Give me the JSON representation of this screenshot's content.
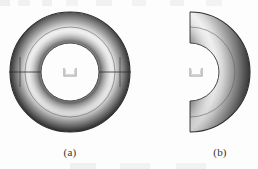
{
  "figure": {
    "kind": "torus-geometry-figure",
    "background_color": "#fdfdfd",
    "panels": [
      {
        "id": "a",
        "caption": "(a)",
        "shape_name": "full-torus",
        "description": "Shaded full torus (annulus) with inner circular outline, horizontal centre line and square origin marker",
        "center": {
          "x": 70,
          "y": 72
        },
        "outer_radius": 62,
        "inner_radius": 30,
        "mid_ring_radius": 46,
        "has_center_marker": true,
        "has_center_line": true,
        "center_line_orientation": "horizontal",
        "shading": {
          "outer_edge": "#3a3a3a",
          "highlight": "#efefef",
          "inner_edge": "#5a5a5a",
          "outline": "#2b2b2b"
        }
      },
      {
        "id": "b",
        "caption": "(b)",
        "shape_name": "half-torus",
        "description": "Shaded half torus cut along the vertical plane, opening to the left, with square origin marker at the centre",
        "center": {
          "x": 4,
          "y": 72
        },
        "outer_radius": 62,
        "inner_radius": 30,
        "mid_ring_radius": 46,
        "sweep": "right half (180 degrees)",
        "has_center_marker": true,
        "has_center_line": false,
        "shading": {
          "outer_edge": "#3a3a3a",
          "highlight": "#efefef",
          "inner_edge": "#5a5a5a",
          "outline": "#2b2b2b"
        }
      }
    ]
  }
}
